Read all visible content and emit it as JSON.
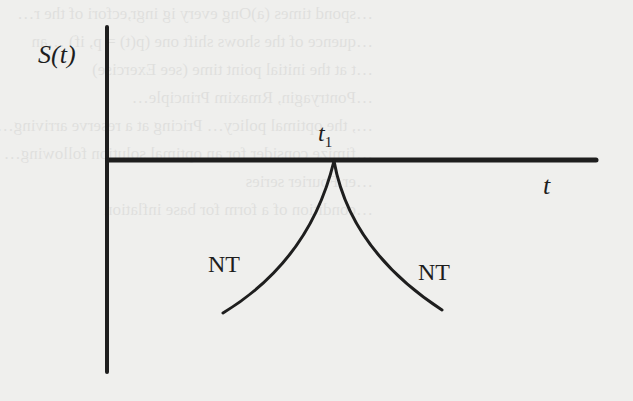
{
  "diagram": {
    "y_axis_label": "S(t)",
    "x_axis_label": "t",
    "point_label_main": "t",
    "point_label_sub": "1",
    "left_branch_label": "NT",
    "right_branch_label": "NT",
    "colors": {
      "ink": "#1e1e1e",
      "paper": "#efefed"
    }
  },
  "background_bleed_text": [
    "…spond times (a)Ong every ig ingr,ecfori of the r…",
    "",
    "…quence of the shows shift one (p(t) = p, if) …an",
    "…t at the initial point time (see Exercise)",
    "",
    "…Pontryagin, Rmaxim Principle…",
    "…, the optimal policy… Pricing at a reserve arriving…",
    "…fimize consider for an optimal solution following…",
    "…er Fourier series",
    "…condition of a form for base inflation"
  ]
}
